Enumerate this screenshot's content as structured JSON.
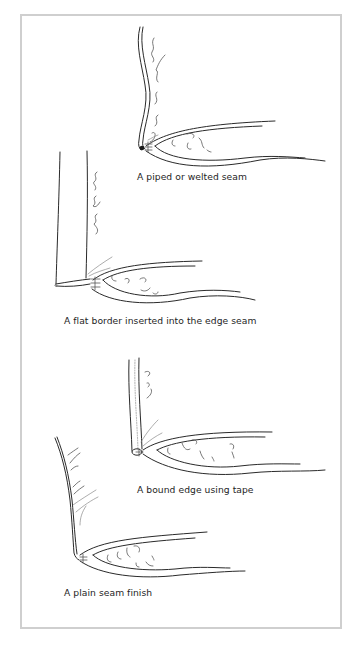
{
  "figure": {
    "frame_border_color": "#cfcfcf",
    "background_color": "#ffffff",
    "ink_color": "#2a2a2a",
    "panels": [
      {
        "id": "piped",
        "caption": "A piped or welted seam"
      },
      {
        "id": "flat-border",
        "caption": "A flat border inserted into the edge seam"
      },
      {
        "id": "bound-edge",
        "caption": "A bound edge using tape"
      },
      {
        "id": "plain",
        "caption": "A plain seam finish"
      }
    ]
  }
}
